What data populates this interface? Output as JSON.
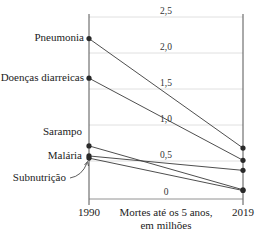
{
  "chart_data": {
    "type": "line",
    "subtype": "slope",
    "title": "",
    "xlabel": "Mortes até os 5 anos, em milhões",
    "xlabel_lines": [
      "Mortes até os 5 anos,",
      "em milhões"
    ],
    "ylabel": "",
    "x": [
      "1990",
      "2019"
    ],
    "ylim": [
      0,
      2.5
    ],
    "y_ticks": [
      "0",
      "0,5",
      "1,0",
      "1,5",
      "2,0",
      "2,5"
    ],
    "grid": true,
    "legend": "none (direct labels at 1990)",
    "series": [
      {
        "name": "Pneumonia",
        "values": [
          2.2,
          0.68
        ]
      },
      {
        "name": "Doenças diarreicas",
        "values": [
          1.65,
          0.51
        ]
      },
      {
        "name": "Sarampo",
        "values": [
          0.71,
          0.1
        ]
      },
      {
        "name": "Malária",
        "values": [
          0.57,
          0.37
        ]
      },
      {
        "name": "Subnutrição",
        "values": [
          0.54,
          0.09
        ]
      }
    ]
  },
  "colors": {
    "line": "#3a3a3a",
    "marker": "#2a2a2a",
    "grid": "#d8d8d8",
    "axis": "#555555"
  }
}
